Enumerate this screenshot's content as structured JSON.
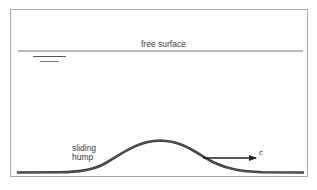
{
  "diagram": {
    "type": "physics-schematic",
    "labels": {
      "free_surface": "free surface",
      "hump_line1": "sliding",
      "hump_line2": "hump",
      "velocity": "c"
    },
    "elements": {
      "free_surface_line": {
        "y": 51,
        "x_start": 18,
        "x_end": 303
      },
      "water_level_symbol": [
        {
          "y": 56,
          "x_start": 33,
          "x_end": 66
        },
        {
          "y": 61,
          "x_start": 40,
          "x_end": 59
        }
      ],
      "bed": {
        "baseline_y": 172,
        "peak_x": 160,
        "peak_y": 140,
        "x_start": 18,
        "x_end": 303
      },
      "velocity_arrow": {
        "x_start": 203,
        "x_end": 256,
        "y": 158,
        "direction": "right"
      }
    },
    "colors": {
      "frame": "#a8a8a8",
      "surface_line": "#6a6a6a",
      "bed": "#3a3a3a",
      "arrow": "#222222",
      "text": "#3a3a3a"
    }
  }
}
